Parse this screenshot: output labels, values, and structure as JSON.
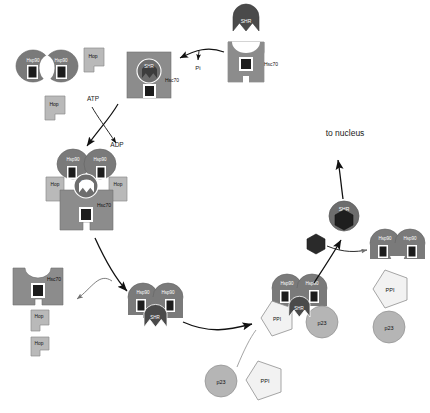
{
  "diagram": {
    "colors": {
      "hsp90": "#7a7a7a",
      "hsc70": "#8c8c8c",
      "hop": "#b9b9b9",
      "shr": "#4a4a4a",
      "p23": "#b5b5b5",
      "ppi": "#f2f2f2",
      "hormone": "#2a2a2a",
      "nucleotide": "#1c1c1c",
      "stroke": "#555555",
      "arrow": "#111111",
      "text": "#1a1a1a",
      "text_light": "#ffffff",
      "background": "#ffffff"
    },
    "labels": {
      "hsp90": "Hsp90",
      "hsc70": "Hsc70",
      "hop": "Hop",
      "shr": "SHR",
      "p23": "p23",
      "ppi": "PPI",
      "atp": "ATP",
      "adp": "ADP",
      "pi": "Pi",
      "to_nucleus": "to nucleus"
    },
    "states": {
      "free_shr": {
        "name": "free-steroid-hormone-receptor",
        "shr_label": "SHR"
      },
      "hsc70_shr_loaded": {
        "name": "hsc70-shr-early-complex",
        "hsc70_label": "Hsc70",
        "shr_label": "SHR"
      },
      "hsp90_dimer_free": {
        "name": "free-hsp90-dimer",
        "left_label": "Hsp90",
        "right_label": "Hsp90"
      },
      "hop_free_upper": {
        "name": "free-hop-upper",
        "label": "Hop"
      },
      "hop_free_lower": {
        "name": "free-hop-lower",
        "label": "Hop"
      },
      "intermediate_complex": {
        "name": "hsp90-hop-hsc70-shr-intermediate-complex",
        "hsp90_left": "Hsp90",
        "hsp90_right": "Hsp90",
        "hop_left": "Hop",
        "hop_right": "Hop",
        "shr_label": "SHR",
        "hsc70_label": "Hsc70"
      },
      "released_hsc70": {
        "name": "released-hsc70-and-hop",
        "hsc70_label": "Hsc70",
        "hop_upper": "Hop",
        "hop_lower": "Hop"
      },
      "hsp90_shr_complex": {
        "name": "hsp90-dimer-shr-complex",
        "hsp90_left": "Hsp90",
        "hsp90_right": "Hsp90",
        "shr_label": "SHR"
      },
      "free_p23": {
        "name": "free-p23",
        "label": "p23"
      },
      "free_ppi": {
        "name": "free-ppi",
        "label": "PPI"
      },
      "mature_complex": {
        "name": "mature-hsp90-shr-p23-ppi-complex",
        "hsp90_left": "Hsp90",
        "hsp90_right": "Hsp90",
        "shr_label": "SHR",
        "p23_label": "p23",
        "ppi_label": "PPI"
      },
      "hormone_ligand": {
        "name": "steroid-hormone-ligand"
      },
      "activated_shr": {
        "name": "activated-shr-hormone-complex",
        "shr_label": "SHR"
      },
      "recycled_hsp90": {
        "name": "recycled-hsp90-dimer",
        "left_label": "Hsp90",
        "right_label": "Hsp90"
      },
      "recycled_ppi": {
        "name": "recycled-ppi",
        "label": "PPI"
      },
      "recycled_p23": {
        "name": "recycled-p23",
        "label": "p23"
      }
    },
    "annotations": {
      "atp": "ATP",
      "adp": "ADP",
      "pi": "Pi",
      "to_nucleus": "to nucleus"
    }
  }
}
